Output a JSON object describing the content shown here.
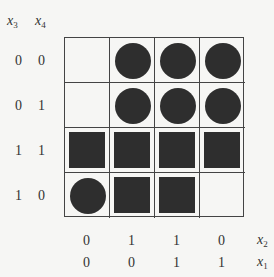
{
  "row_header": {
    "var1": "x",
    "sub1": "3",
    "var2": "x",
    "sub2": "4"
  },
  "row_labels": [
    {
      "x3": "0",
      "x4": "0"
    },
    {
      "x3": "0",
      "x4": "1"
    },
    {
      "x3": "1",
      "x4": "1"
    },
    {
      "x3": "1",
      "x4": "0"
    }
  ],
  "col_labels_x2": [
    "0",
    "1",
    "1",
    "0"
  ],
  "col_labels_x1": [
    "0",
    "0",
    "1",
    "1"
  ],
  "col_var_x2": {
    "var": "x",
    "sub": "2"
  },
  "col_var_x1": {
    "var": "x",
    "sub": "1"
  },
  "cells": [
    [
      "empty",
      "circle",
      "circle",
      "circle"
    ],
    [
      "empty",
      "circle",
      "circle",
      "circle"
    ],
    [
      "square",
      "square",
      "square",
      "square"
    ],
    [
      "circle",
      "square",
      "square",
      "empty"
    ]
  ],
  "colors": {
    "mark": "#2e2e2e",
    "grid": "#444444",
    "background": "#f6f6f4"
  }
}
